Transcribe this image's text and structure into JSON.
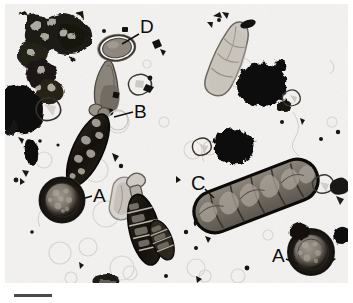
{
  "figure": {
    "type": "light-microscopy-micrograph",
    "width": 353,
    "height": 303,
    "background_color": "#f3f2f0",
    "frame_color": "#ffffff",
    "specimen_description": "Mixed fungal spore preparation with dark debris, viewed by brightfield light microscopy",
    "label_color": "#121212",
    "scalebar": {
      "name": "scale-bar",
      "x": 14,
      "y": 295,
      "length": 38,
      "thickness": 3,
      "color": "#4a4a4a",
      "caption": ""
    },
    "labels": [
      {
        "id": "D",
        "text": "D",
        "x": 143,
        "y": 32,
        "leader_x2": 122,
        "leader_y2": 44,
        "target": "thick-walled-oval-spore"
      },
      {
        "id": "B",
        "text": "B",
        "x": 136,
        "y": 115,
        "leader_x2": 114,
        "leader_y2": 118,
        "target": "tapered-conical-spore"
      },
      {
        "id": "A_left",
        "text": "A",
        "x": 95,
        "y": 196,
        "leader_x2": 84,
        "leader_y2": 199,
        "target": "round-thick-walled-spore-left"
      },
      {
        "id": "C",
        "text": "C",
        "x": 196,
        "y": 188,
        "leader_x2": 211,
        "leader_y2": 196,
        "target": "large-multicellular-macroconidium"
      },
      {
        "id": "A_right",
        "text": "A",
        "x": 280,
        "y": 258,
        "leader_x2": 296,
        "leader_y2": 261,
        "target": "round-thick-walled-spore-right"
      }
    ],
    "objects": [
      {
        "name": "debris-chain-cluster-topleft",
        "kind": "dark-cell-chain",
        "cx": 45,
        "cy": 40,
        "tone": "#1d1b19"
      },
      {
        "name": "solid-black-mass-left",
        "kind": "opaque-debris",
        "cx": 28,
        "cy": 105,
        "tone": "#0a0a0a"
      },
      {
        "name": "small-dark-blob-left",
        "kind": "opaque-debris",
        "cx": 31,
        "cy": 152,
        "tone": "#131313"
      },
      {
        "name": "thick-walled-oval-spore",
        "kind": "oval-spore",
        "cx": 117,
        "cy": 48,
        "rx": 17,
        "ry": 12,
        "tone": "#7b756e"
      },
      {
        "name": "tapered-conical-spore",
        "kind": "conidium",
        "cx": 110,
        "cy": 95,
        "tone": "#6e6860"
      },
      {
        "name": "dark-elongate-spore-upper",
        "kind": "multiseptate-conidium",
        "cx": 88,
        "cy": 150,
        "tone": "#17150f"
      },
      {
        "name": "round-thick-walled-spore-left",
        "kind": "chlamydospore",
        "cx": 62,
        "cy": 200,
        "r": 22,
        "tone": "#221f1b"
      },
      {
        "name": "pale-capsule-center",
        "kind": "hyaline-spore",
        "cx": 123,
        "cy": 198,
        "tone": "#b8b3ad"
      },
      {
        "name": "dark-spindle-spore-center",
        "kind": "multiseptate-conidium",
        "cx": 143,
        "cy": 228,
        "tone": "#161310"
      },
      {
        "name": "small-segmented-ellipse",
        "kind": "septate-conidium",
        "cx": 160,
        "cy": 240,
        "tone": "#241f1a"
      },
      {
        "name": "pale-elongate-spore-topright",
        "kind": "hyaline-conidium",
        "cx": 228,
        "cy": 60,
        "tone": "#a7a29c"
      },
      {
        "name": "black-debris-clump-topright",
        "kind": "opaque-debris",
        "cx": 262,
        "cy": 85,
        "tone": "#0c0c0c"
      },
      {
        "name": "small-black-fleck-top",
        "kind": "opaque-debris",
        "cx": 246,
        "cy": 25,
        "tone": "#101010"
      },
      {
        "name": "black-debris-clump-mid",
        "kind": "opaque-debris",
        "cx": 232,
        "cy": 145,
        "tone": "#0e0e0e"
      },
      {
        "name": "large-multicellular-macroconidium",
        "kind": "macroconidium",
        "cx": 256,
        "cy": 196,
        "length": 130,
        "width": 40,
        "angle": -21,
        "tone": "#6f6a63"
      },
      {
        "name": "round-thick-walled-spore-right",
        "kind": "chlamydospore",
        "cx": 311,
        "cy": 252,
        "r": 23,
        "tone": "#231f1b"
      },
      {
        "name": "crystal-debris-right",
        "kind": "refractile-debris",
        "cx": 330,
        "cy": 190,
        "tone": "#3b3833"
      },
      {
        "name": "bubble-field",
        "kind": "faint-circular-artifacts",
        "cx": 150,
        "cy": 260,
        "tone": "#d8d5d1"
      }
    ]
  }
}
